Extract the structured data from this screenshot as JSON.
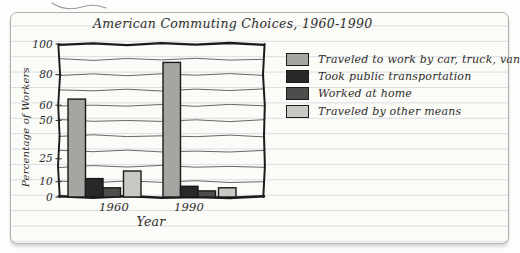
{
  "title": "American Commuting Choices, 1960-1990",
  "chart_data": {
    "type": "bar",
    "title": "American Commuting Choices, 1960-1990",
    "xlabel": "Year",
    "ylabel": "Percentage of Workers",
    "ylim": [
      0,
      100
    ],
    "grid": true,
    "legend_position": "right",
    "ytick_labels": [
      "100",
      "80",
      "60",
      "50",
      "25",
      "10",
      "0"
    ],
    "ytick_values": [
      100,
      80,
      60,
      50,
      25,
      10,
      0
    ],
    "gridline_values": [
      10,
      20,
      30,
      40,
      50,
      60,
      70,
      80,
      90
    ],
    "categories": [
      "1960",
      "1990"
    ],
    "series": [
      {
        "name": "Traveled to work by car, truck, van",
        "color": "#a4a6a2",
        "values": [
          64,
          88
        ]
      },
      {
        "name": "Took public transportation",
        "color": "#282828",
        "values": [
          12,
          7
        ]
      },
      {
        "name": "Worked at home",
        "color": "#4f4d4b",
        "values": [
          6,
          4
        ]
      },
      {
        "name": "Traveled by other means",
        "color": "#c8c8c5",
        "values": [
          17,
          6
        ]
      }
    ]
  },
  "style": {
    "paper": "#fbfbf7",
    "rule_line": "#d7dde3",
    "ink": "#2e2e2e",
    "frame": "#1b1b1b",
    "card_border": "#adadad"
  }
}
